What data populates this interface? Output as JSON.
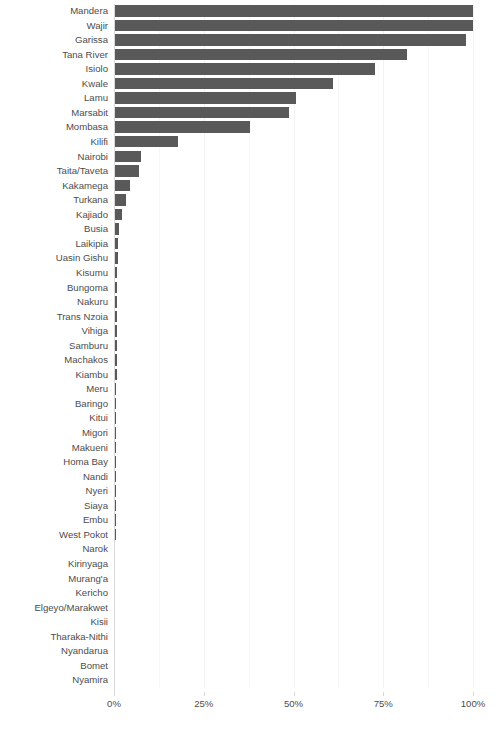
{
  "chart_data": {
    "type": "bar",
    "orientation": "horizontal",
    "title": "",
    "xlabel": "",
    "ylabel": "",
    "xlim": [
      0,
      100
    ],
    "xticks": [
      0,
      25,
      50,
      75,
      100
    ],
    "xtick_labels": [
      "0%",
      "25%",
      "50%",
      "75%",
      "100%"
    ],
    "grid": true,
    "grid_axis": "x",
    "bar_color": "#595959",
    "legend": "none",
    "categories": [
      "Mandera",
      "Wajir",
      "Garissa",
      "Tana River",
      "Isiolo",
      "Kwale",
      "Lamu",
      "Marsabit",
      "Mombasa",
      "Kilifi",
      "Nairobi",
      "Taita/Taveta",
      "Kakamega",
      "Turkana",
      "Kajiado",
      "Busia",
      "Laikipia",
      "Uasin Gishu",
      "Kisumu",
      "Bungoma",
      "Nakuru",
      "Trans Nzoia",
      "Vihiga",
      "Samburu",
      "Machakos",
      "Kiambu",
      "Meru",
      "Baringo",
      "Kitui",
      "Migori",
      "Makueni",
      "Homa Bay",
      "Nandi",
      "Nyeri",
      "Siaya",
      "Embu",
      "West Pokot",
      "Narok",
      "Kirinyaga",
      "Murang'a",
      "Kericho",
      "Elgeyo/Marakwet",
      "Kisii",
      "Tharaka-Nithi",
      "Nyandarua",
      "Bomet",
      "Nyamira"
    ],
    "values": [
      100.0,
      100.0,
      98.0,
      81.5,
      72.7,
      61.0,
      50.7,
      48.7,
      37.9,
      17.8,
      7.5,
      7.0,
      4.5,
      3.3,
      2.2,
      1.4,
      1.1,
      1.0,
      0.95,
      0.9,
      0.85,
      0.8,
      0.78,
      0.75,
      0.72,
      0.7,
      0.68,
      0.65,
      0.62,
      0.6,
      0.58,
      0.55,
      0.52,
      0.5,
      0.48,
      0.45,
      0.42,
      0.4,
      0.38,
      0.35,
      0.32,
      0.3,
      0.28,
      0.25,
      0.2,
      0.15,
      0.1
    ]
  }
}
